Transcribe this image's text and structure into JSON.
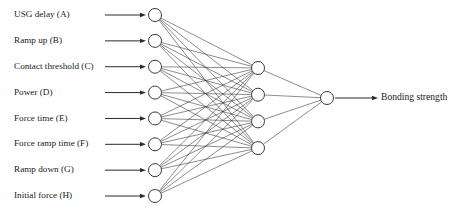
{
  "figure": {
    "background_color": "#ffffff",
    "width": 465,
    "height": 219
  },
  "colors": {
    "node_stroke": "#3a3a3a",
    "node_fill": "#ffffff",
    "edge": "#2e2e2e",
    "arrow": "#2b2b2b",
    "text": "#1a1a1a"
  },
  "network": {
    "type": "feedforward-neural-network",
    "layer_counts": [
      8,
      4,
      1
    ],
    "fully_connected": true,
    "input_layer": {
      "name": "input-layer",
      "node_count": 8,
      "nodes": [
        {
          "id": "A",
          "label": "USG delay (A)"
        },
        {
          "id": "B",
          "label": "Ramp up (B)"
        },
        {
          "id": "C",
          "label": "Contact threshold (C)"
        },
        {
          "id": "D",
          "label": "Power (D)"
        },
        {
          "id": "E",
          "label": "Force time (E)"
        },
        {
          "id": "F",
          "label": "Force ramp time (F)"
        },
        {
          "id": "G",
          "label": "Ramp down (G)"
        },
        {
          "id": "H",
          "label": "Initial force (H)"
        }
      ]
    },
    "hidden_layer": {
      "name": "hidden-layer",
      "node_count": 4,
      "nodes": [
        {
          "id": "H1",
          "label": ""
        },
        {
          "id": "H2",
          "label": ""
        },
        {
          "id": "H3",
          "label": ""
        },
        {
          "id": "H4",
          "label": ""
        }
      ]
    },
    "output_layer": {
      "name": "output-layer",
      "node_count": 1,
      "nodes": [
        {
          "id": "O1",
          "label": "Bonding strength"
        }
      ]
    }
  },
  "geometry": {
    "input_x": 155,
    "input_y_start": 15,
    "input_y_step": 25.86,
    "hidden_x": 258,
    "hidden_y_start": 68,
    "hidden_y_step": 26.7,
    "output_x": 327,
    "output_y": 98,
    "node_radius": 6.5,
    "input_label_x": 14,
    "input_arrow_end_x": 146,
    "input_arrow_min_start_x": 105,
    "output_arrow_start_x": 335,
    "output_arrow_end_x": 378,
    "output_label_x": 381,
    "arrow_head_length": 6,
    "arrow_head_width": 4.4
  }
}
